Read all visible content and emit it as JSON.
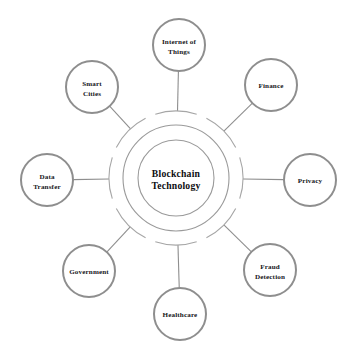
{
  "diagram": {
    "type": "radial-hub-and-spoke",
    "background_color": "#ffffff",
    "node_stroke_color": "#8e8e8e",
    "ring_stroke_color": "#9a9a9a",
    "label_color": "#16161a",
    "hub": {
      "label_line1": "Blockchain",
      "label_line2": "Technology",
      "center_x": 176,
      "center_y": 178,
      "inner_radius": 38,
      "middle_radius": 53,
      "outer_arc_radius": 67
    },
    "node_radius": 26,
    "spokes": [
      {
        "id": "internet-of-things",
        "label_line1": "Internet of",
        "label_line2": "Things",
        "angle_deg": -90,
        "cx": 179,
        "cy": 45
      },
      {
        "id": "finance",
        "label_line1": "Finance",
        "label_line2": "",
        "angle_deg": -45,
        "cx": 271,
        "cy": 85
      },
      {
        "id": "privacy",
        "label_line1": "Privacy",
        "label_line2": "",
        "angle_deg": 0,
        "cx": 310,
        "cy": 180
      },
      {
        "id": "fraud-detection",
        "label_line1": "Fraud",
        "label_line2": "Detection",
        "angle_deg": 45,
        "cx": 270,
        "cy": 270
      },
      {
        "id": "healthcare",
        "label_line1": "Healthcare",
        "label_line2": "",
        "angle_deg": 90,
        "cx": 180,
        "cy": 314
      },
      {
        "id": "government",
        "label_line1": "Government",
        "label_line2": "",
        "angle_deg": 135,
        "cx": 89,
        "cy": 271
      },
      {
        "id": "data-transfer",
        "label_line1": "Data",
        "label_line2": "Transfer",
        "angle_deg": 180,
        "cx": 47,
        "cy": 180
      },
      {
        "id": "smart-cities",
        "label_line1": "Smart",
        "label_line2": "Cities",
        "angle_deg": -135,
        "cx": 92,
        "cy": 87
      }
    ]
  }
}
